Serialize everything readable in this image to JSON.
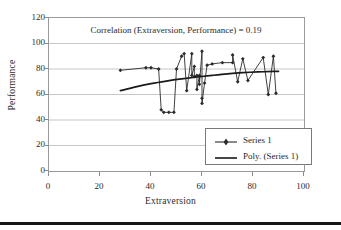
{
  "chart_data": {
    "type": "scatter",
    "title": "Correlation (Extraversion, Performance) = 0.19",
    "xlabel": "Extraversion",
    "ylabel": "Performance",
    "xlim": [
      0,
      100
    ],
    "ylim": [
      0,
      120
    ],
    "xticks": [
      0,
      20,
      40,
      60,
      80,
      100
    ],
    "yticks": [
      0,
      20,
      40,
      60,
      80,
      100,
      120
    ],
    "grid": "horizontal",
    "legend_position": "inside-lower-right",
    "series": [
      {
        "name": "Series 1",
        "kind": "line-marker",
        "color": "#2b2b2b",
        "marker": "diamond",
        "points": [
          [
            28,
            79
          ],
          [
            38,
            81
          ],
          [
            40,
            81
          ],
          [
            43,
            80
          ],
          [
            44,
            48
          ],
          [
            45,
            46
          ],
          [
            47,
            46
          ],
          [
            49,
            46
          ],
          [
            50,
            80
          ],
          [
            52,
            90
          ],
          [
            53,
            92
          ],
          [
            54,
            63
          ],
          [
            56,
            92
          ],
          [
            56,
            75
          ],
          [
            57,
            82
          ],
          [
            57,
            74
          ],
          [
            58,
            75
          ],
          [
            58,
            64
          ],
          [
            59,
            75
          ],
          [
            59,
            68
          ],
          [
            60,
            94
          ],
          [
            60,
            57
          ],
          [
            60,
            53
          ],
          [
            61,
            69
          ],
          [
            62,
            83
          ],
          [
            64,
            84
          ],
          [
            68,
            85
          ],
          [
            72,
            85
          ],
          [
            72,
            91
          ],
          [
            74,
            70
          ],
          [
            76,
            88
          ],
          [
            78,
            71
          ],
          [
            84,
            89
          ],
          [
            86,
            60
          ],
          [
            88,
            90
          ],
          [
            89,
            61
          ]
        ]
      },
      {
        "name": "Poly. (Series 1)",
        "kind": "trendline",
        "color": "#1a1a1a",
        "points": [
          [
            28,
            63
          ],
          [
            34,
            66
          ],
          [
            40,
            68.5
          ],
          [
            46,
            70.5
          ],
          [
            52,
            72.2
          ],
          [
            58,
            73.7
          ],
          [
            64,
            75
          ],
          [
            70,
            76.2
          ],
          [
            76,
            77.1
          ],
          [
            82,
            77.7
          ],
          [
            88,
            78.1
          ],
          [
            90,
            78.2
          ]
        ]
      }
    ]
  },
  "legend": {
    "entries": [
      {
        "label": "Series 1"
      },
      {
        "label": "Poly. (Series 1)"
      }
    ]
  }
}
